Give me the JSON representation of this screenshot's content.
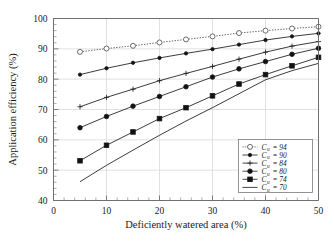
{
  "chart_data": {
    "type": "line",
    "title": "",
    "xlabel": "Deficiently watered area (%)",
    "ylabel": "Application efficiency (%)",
    "xlim": [
      0,
      50
    ],
    "ylim": [
      40,
      100
    ],
    "xticks": [
      0,
      10,
      20,
      30,
      40,
      50
    ],
    "yticks": [
      40,
      50,
      60,
      70,
      80,
      90,
      100
    ],
    "xtick_labels": [
      "0",
      "10",
      "20",
      "30",
      "40",
      "50"
    ],
    "ytick_labels": [
      "40",
      "50",
      "60",
      "70",
      "80",
      "90",
      "100"
    ],
    "grid": true,
    "minor_ticks": true,
    "legend_position": "lower-right",
    "x": [
      5,
      10,
      15,
      20,
      25,
      30,
      35,
      40,
      45,
      50
    ],
    "series": [
      {
        "name": "Cu = 94",
        "legend_symbol": "C",
        "legend_subscript": "u",
        "legend_value": "= 94",
        "marker": "open-circle",
        "line_style": "dotted",
        "values": [
          89.0,
          90.1,
          91.0,
          92.1,
          93.1,
          94.1,
          95.2,
          96.0,
          96.7,
          97.3
        ]
      },
      {
        "name": "Cu = 90",
        "legend_symbol": "C",
        "legend_subscript": "u",
        "legend_value": "= 90",
        "marker": "small-solid",
        "line_style": "solid",
        "values": [
          81.5,
          83.6,
          85.4,
          87.0,
          88.5,
          89.9,
          91.4,
          92.9,
          94.1,
          95.1
        ]
      },
      {
        "name": "Cu = 84",
        "legend_symbol": "C",
        "legend_subscript": "u",
        "legend_value": "= 84",
        "marker": "plus",
        "line_style": "solid",
        "values": [
          70.9,
          74.0,
          76.7,
          79.5,
          81.9,
          84.2,
          86.6,
          88.9,
          90.9,
          92.4
        ]
      },
      {
        "name": "Cu = 80",
        "legend_symbol": "C",
        "legend_subscript": "u",
        "legend_value": "= 80",
        "marker": "solid-circle",
        "line_style": "solid",
        "values": [
          64.0,
          67.7,
          71.1,
          74.3,
          77.5,
          80.7,
          83.4,
          85.8,
          88.2,
          90.2
        ]
      },
      {
        "name": "Cu = 74",
        "legend_symbol": "C",
        "legend_subscript": "u",
        "legend_value": "= 74",
        "marker": "solid-square",
        "line_style": "solid",
        "values": [
          53.1,
          58.2,
          62.6,
          67.0,
          70.6,
          74.5,
          78.4,
          81.5,
          84.4,
          87.2
        ]
      },
      {
        "name": "Cu = 70",
        "legend_symbol": "C",
        "legend_subscript": "u",
        "legend_value": "= 70",
        "marker": "none",
        "line_style": "solid",
        "values": [
          46.2,
          51.6,
          56.6,
          61.5,
          66.2,
          70.6,
          75.2,
          79.8,
          82.8,
          85.2
        ]
      }
    ]
  }
}
